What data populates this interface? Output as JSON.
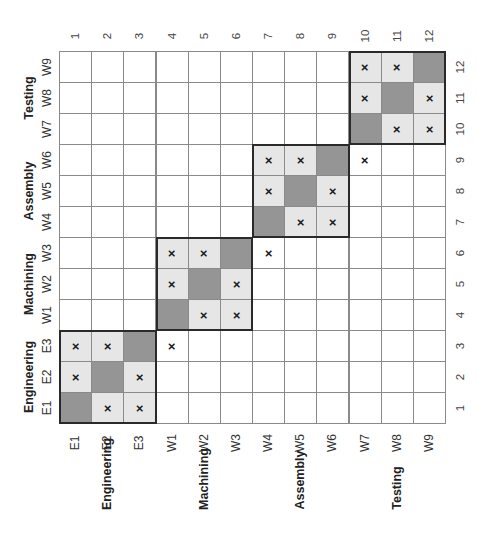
{
  "figure": {
    "type": "design-structure-matrix",
    "orientation": "rotated-90-ccw",
    "row_labels_top_to_bottom": [
      "W9",
      "W8",
      "W7",
      "W6",
      "W5",
      "W4",
      "W3",
      "W2",
      "W1",
      "E3",
      "E2",
      "E1"
    ],
    "row_numbers_top_to_bottom": [
      "12",
      "11",
      "10",
      "9",
      "8",
      "7",
      "6",
      "5",
      "4",
      "3",
      "2",
      "1"
    ],
    "column_labels_left_to_right": [
      "E1",
      "E2",
      "E3",
      "W1",
      "W2",
      "W3",
      "W4",
      "W5",
      "W6",
      "W7",
      "W8",
      "W9"
    ],
    "column_numbers_left_to_right": [
      "1",
      "2",
      "3",
      "4",
      "5",
      "6",
      "7",
      "8",
      "9",
      "10",
      "11",
      "12"
    ],
    "groups": [
      {
        "name": "Engineering",
        "members": [
          "E1",
          "E2",
          "E3"
        ],
        "range": [
          1,
          3
        ]
      },
      {
        "name": "Machining",
        "members": [
          "W1",
          "W2",
          "W3"
        ],
        "range": [
          4,
          6
        ]
      },
      {
        "name": "Assembly",
        "members": [
          "W4",
          "W5",
          "W6"
        ],
        "range": [
          7,
          9
        ]
      },
      {
        "name": "Testing",
        "members": [
          "W7",
          "W8",
          "W9"
        ],
        "range": [
          10,
          12
        ]
      }
    ],
    "mark_symbol": "×",
    "marks_by_row_number": {
      "1": [
        2,
        3
      ],
      "2": [
        1,
        3
      ],
      "3": [
        1,
        2,
        4
      ],
      "4": [
        5,
        6
      ],
      "5": [
        4,
        6
      ],
      "6": [
        4,
        5,
        7
      ],
      "7": [
        8,
        9
      ],
      "8": [
        7,
        9
      ],
      "9": [
        7,
        8,
        10
      ],
      "10": [
        11,
        12
      ],
      "11": [
        10,
        12
      ],
      "12": [
        10,
        11
      ]
    },
    "colors": {
      "diagonal": "#959595",
      "in_block": "#e6e6e6",
      "empty": "#ffffff",
      "grid_line": "#8a8a8a",
      "block_border": "#2a2a2a"
    }
  }
}
